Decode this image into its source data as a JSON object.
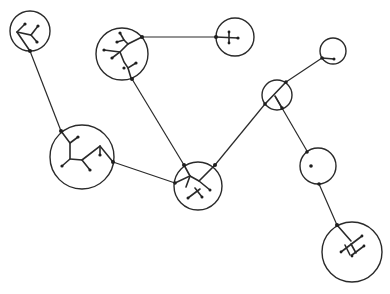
{
  "diagram": {
    "title": "",
    "colors": {
      "ink": "#2a2a2a",
      "background": "#ffffff"
    },
    "nodes": [
      {
        "id": "A",
        "cx": 30,
        "cy": 31,
        "r": 20
      },
      {
        "id": "B",
        "cx": 122,
        "cy": 54,
        "r": 26
      },
      {
        "id": "C",
        "cx": 235,
        "cy": 37,
        "r": 19
      },
      {
        "id": "D",
        "cx": 82,
        "cy": 157,
        "r": 32
      },
      {
        "id": "E",
        "cx": 198,
        "cy": 186,
        "r": 24
      },
      {
        "id": "F",
        "cx": 277,
        "cy": 95,
        "r": 15
      },
      {
        "id": "G",
        "cx": 333,
        "cy": 51,
        "r": 13
      },
      {
        "id": "H",
        "cx": 318,
        "cy": 166,
        "r": 18
      },
      {
        "id": "I",
        "cx": 352,
        "cy": 252,
        "r": 30
      }
    ],
    "edges": [
      {
        "from": "A",
        "to": "D"
      },
      {
        "from": "B",
        "to": "C"
      },
      {
        "from": "B",
        "to": "E"
      },
      {
        "from": "D",
        "to": "E"
      },
      {
        "from": "E",
        "to": "F"
      },
      {
        "from": "F",
        "to": "G"
      },
      {
        "from": "F",
        "to": "H"
      },
      {
        "from": "H",
        "to": "I"
      }
    ]
  }
}
